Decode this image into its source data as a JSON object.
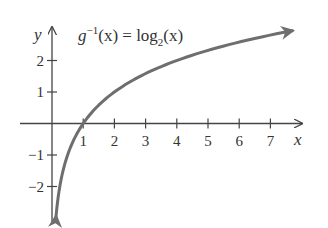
{
  "chart_data": {
    "type": "line",
    "title_parts": {
      "fn": "g",
      "sup": "−1",
      "arg": "(x) = log",
      "sub": "2",
      "tail": "(x)"
    },
    "xlabel": "x",
    "ylabel": "y",
    "xlim": [
      -0.5,
      8
    ],
    "ylim": [
      -3,
      3
    ],
    "x_ticks": [
      1,
      2,
      3,
      4,
      5,
      6,
      7
    ],
    "x_tick_labels": [
      "1",
      "2",
      "3",
      "4",
      "5",
      "6",
      "7"
    ],
    "y_ticks": [
      2,
      1,
      -1,
      -2
    ],
    "y_tick_labels": [
      "2",
      "1",
      "−1",
      "−2"
    ],
    "grid": false,
    "legend": null,
    "series": [
      {
        "name": "log2(x)",
        "color": "#6e6e6e",
        "x": [
          0.125,
          0.25,
          0.5,
          1,
          2,
          3,
          4,
          5,
          6,
          7,
          7.7
        ],
        "y": [
          -3,
          -2,
          -1,
          0,
          1,
          1.585,
          2,
          2.322,
          2.585,
          2.807,
          2.945
        ],
        "arrows_at_ends": true
      }
    ],
    "colors": {
      "axis": "#444444",
      "curve": "#6e6e6e",
      "text": "#333333"
    }
  }
}
